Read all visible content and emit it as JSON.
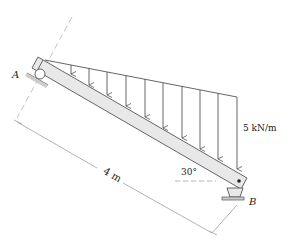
{
  "diagram": {
    "type": "inclined-beam-with-distributed-load",
    "labels": {
      "support_a": "A",
      "support_b": "B",
      "length": "4 m",
      "angle": "30°",
      "load": "5 kN/m"
    },
    "colors": {
      "beam_fill": "#e8e8e8",
      "stroke": "#444444",
      "dim_line": "#aaaaaa"
    }
  }
}
